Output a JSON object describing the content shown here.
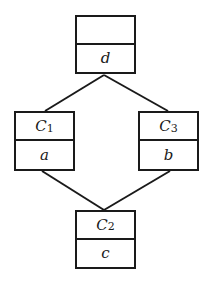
{
  "diagram": {
    "type": "lattice",
    "nodes": [
      {
        "id": "top",
        "name": "",
        "subscript": "",
        "value": "d",
        "x": 75,
        "y": 15,
        "w": 61,
        "h": 59
      },
      {
        "id": "left",
        "name": "C",
        "subscript": "1",
        "value": "a",
        "x": 14,
        "y": 111,
        "w": 61,
        "h": 60
      },
      {
        "id": "right",
        "name": "C",
        "subscript": "3",
        "value": "b",
        "x": 138,
        "y": 111,
        "w": 61,
        "h": 60
      },
      {
        "id": "bottom",
        "name": "C",
        "subscript": "2",
        "value": "c",
        "x": 75,
        "y": 210,
        "w": 61,
        "h": 59
      }
    ],
    "edges": [
      {
        "from": "top",
        "to": "left",
        "x1": 104,
        "y1": 75,
        "x2": 45,
        "y2": 111
      },
      {
        "from": "top",
        "to": "right",
        "x1": 104,
        "y1": 75,
        "x2": 168,
        "y2": 111
      },
      {
        "from": "left",
        "to": "bottom",
        "x1": 42,
        "y1": 171,
        "x2": 104,
        "y2": 210
      },
      {
        "from": "right",
        "to": "bottom",
        "x1": 170,
        "y1": 171,
        "x2": 104,
        "y2": 210
      }
    ],
    "stroke_color": "#1a1a1a"
  }
}
